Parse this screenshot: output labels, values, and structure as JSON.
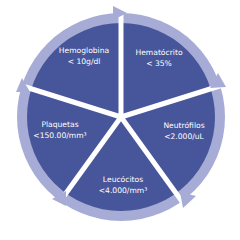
{
  "colors": {
    "segment_fill": "#47569a",
    "ring": "#a7acd6",
    "text": "#ffffff",
    "background": "#ffffff"
  },
  "segments": [
    {
      "name": "Hemoglobina",
      "value": "< 10g/dl"
    },
    {
      "name": "Hematócrito",
      "value": "< 35%"
    },
    {
      "name": "Neutrófilos",
      "value": "<2.000/uL"
    },
    {
      "name": "Leucócitos",
      "value": "<4.000/mm³"
    },
    {
      "name": "Plaquetas",
      "value": "<150.00/mm³"
    }
  ]
}
